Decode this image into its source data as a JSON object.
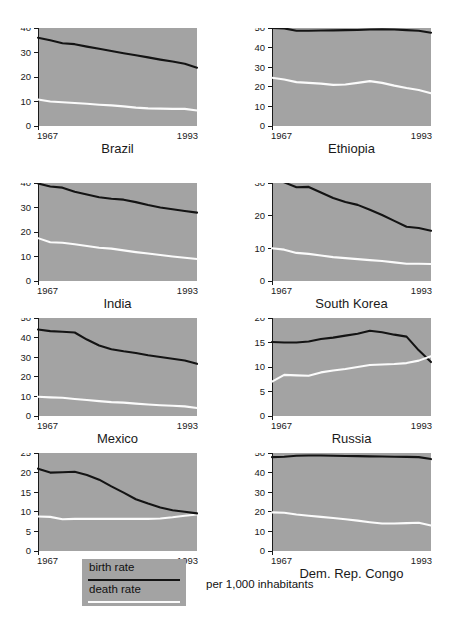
{
  "figure": {
    "units_caption": "per 1,000 inhabitants",
    "x_start_label": "1967",
    "x_end_label": "1993",
    "colors": {
      "panel_background": "#a3a3a3",
      "birth_rate_line": "#141414",
      "death_rate_line": "#fbfbfb",
      "page_background": "#ffffff",
      "axis": "#1a1a1a"
    }
  },
  "legend": {
    "birth_label": "birth rate",
    "death_label": "death rate"
  },
  "chart_data": {
    "type": "line",
    "title": "",
    "xlabel": "",
    "ylabel": "",
    "units": "per 1,000 inhabitants",
    "grid": false,
    "legend_position": "bottom-left",
    "xlim": [
      1967,
      1993
    ],
    "x": [
      1967,
      1969,
      1971,
      1973,
      1975,
      1977,
      1979,
      1981,
      1983,
      1985,
      1987,
      1989,
      1991,
      1993
    ],
    "series_names": [
      "birth rate",
      "death rate"
    ],
    "panels": [
      {
        "name": "Brazil",
        "ylim": [
          0,
          40
        ],
        "yticks": [
          0,
          10,
          20,
          30,
          40
        ],
        "series": [
          {
            "name": "birth rate",
            "values": [
              36.0,
              35.0,
              33.8,
              33.4,
              32.4,
              31.5,
              30.6,
              29.7,
              28.9,
              28.0,
              27.1,
              26.3,
              25.4,
              23.8
            ]
          },
          {
            "name": "death rate",
            "values": [
              10.8,
              10.0,
              9.7,
              9.4,
              9.1,
              8.7,
              8.4,
              8.0,
              7.5,
              7.2,
              7.1,
              7.0,
              7.0,
              6.3
            ]
          }
        ]
      },
      {
        "name": "Ethiopia",
        "ylim": [
          0,
          50
        ],
        "yticks": [
          0,
          10,
          20,
          30,
          40,
          50
        ],
        "series": [
          {
            "name": "birth rate",
            "values": [
              50.0,
              49.8,
              48.6,
              48.6,
              48.7,
              48.8,
              48.9,
              49.0,
              49.2,
              49.3,
              49.2,
              48.9,
              48.6,
              47.6
            ]
          },
          {
            "name": "death rate",
            "values": [
              24.6,
              23.7,
              22.4,
              22.0,
              21.6,
              21.0,
              21.2,
              22.0,
              22.9,
              22.0,
              20.6,
              19.4,
              18.4,
              16.7
            ]
          }
        ]
      },
      {
        "name": "India",
        "ylim": [
          0,
          40
        ],
        "yticks": [
          0,
          10,
          20,
          30,
          40
        ],
        "series": [
          {
            "name": "birth rate",
            "values": [
              39.8,
              38.6,
              38.1,
              36.4,
              35.3,
              34.2,
              33.6,
              33.2,
              32.2,
              31.0,
              30.0,
              29.3,
              28.6,
              27.9
            ]
          },
          {
            "name": "death rate",
            "values": [
              17.5,
              15.8,
              15.6,
              15.0,
              14.3,
              13.6,
              13.2,
              12.5,
              11.8,
              11.2,
              10.6,
              10.0,
              9.5,
              9.0
            ]
          }
        ]
      },
      {
        "name": "South Korea",
        "ylim": [
          0,
          30
        ],
        "yticks": [
          0,
          10,
          20,
          30
        ],
        "series": [
          {
            "name": "birth rate",
            "values": [
              31.9,
              30.2,
              28.7,
              28.8,
              27.1,
              25.4,
              24.2,
              23.3,
              21.8,
              20.2,
              18.4,
              16.6,
              16.2,
              15.4
            ]
          },
          {
            "name": "death rate",
            "values": [
              10.0,
              9.6,
              8.6,
              8.3,
              7.8,
              7.3,
              7.0,
              6.7,
              6.4,
              6.1,
              5.7,
              5.3,
              5.3,
              5.2
            ]
          }
        ]
      },
      {
        "name": "Mexico",
        "ylim": [
          0,
          50
        ],
        "yticks": [
          0,
          10,
          20,
          30,
          40,
          50
        ],
        "series": [
          {
            "name": "birth rate",
            "values": [
              44.1,
              43.3,
              43.0,
              42.6,
              39.0,
              36.0,
              34.1,
              33.0,
              32.1,
              31.0,
              30.1,
              29.2,
              28.3,
              26.6
            ]
          },
          {
            "name": "death rate",
            "values": [
              9.8,
              9.5,
              9.3,
              8.7,
              8.2,
              7.6,
              7.1,
              6.8,
              6.3,
              5.9,
              5.5,
              5.2,
              4.9,
              4.1
            ]
          }
        ]
      },
      {
        "name": "Russia",
        "ylim": [
          0,
          20
        ],
        "yticks": [
          0,
          5,
          10,
          15,
          20
        ],
        "series": [
          {
            "name": "birth rate",
            "values": [
              15.1,
              15.0,
              15.0,
              15.2,
              15.7,
              16.0,
              16.4,
              16.8,
              17.4,
              17.1,
              16.6,
              16.2,
              13.4,
              11.0
            ]
          },
          {
            "name": "death rate",
            "values": [
              7.0,
              8.4,
              8.3,
              8.2,
              8.9,
              9.3,
              9.6,
              10.0,
              10.4,
              10.5,
              10.6,
              10.8,
              11.3,
              12.2
            ]
          }
        ]
      },
      {
        "name": "Spain",
        "ylim": [
          0,
          25
        ],
        "yticks": [
          0,
          5,
          10,
          15,
          20,
          25
        ],
        "series": [
          {
            "name": "birth rate",
            "values": [
              21.0,
              20.0,
              20.1,
              20.2,
              19.4,
              18.2,
              16.5,
              14.9,
              13.2,
              12.1,
              11.1,
              10.4,
              10.0,
              9.6
            ]
          },
          {
            "name": "death rate",
            "values": [
              8.8,
              8.7,
              8.1,
              8.2,
              8.2,
              8.2,
              8.2,
              8.2,
              8.2,
              8.2,
              8.3,
              8.6,
              9.0,
              9.3
            ]
          }
        ]
      },
      {
        "name": "Dem. Rep. Congo",
        "ylim": [
          0,
          50
        ],
        "yticks": [
          0,
          10,
          20,
          30,
          40,
          50
        ],
        "series": [
          {
            "name": "birth rate",
            "values": [
              47.9,
              48.1,
              48.6,
              48.7,
              48.7,
              48.6,
              48.5,
              48.4,
              48.3,
              48.2,
              48.1,
              48.0,
              47.9,
              46.9
            ]
          },
          {
            "name": "death rate",
            "values": [
              19.7,
              19.5,
              18.6,
              18.0,
              17.4,
              16.8,
              16.2,
              15.5,
              14.7,
              14.0,
              14.0,
              14.2,
              14.4,
              13.0
            ]
          }
        ]
      }
    ]
  }
}
